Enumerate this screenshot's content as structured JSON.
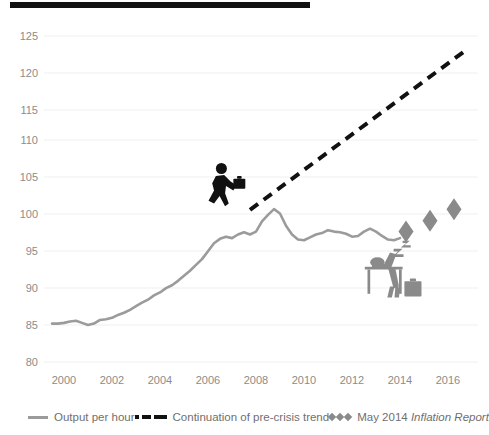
{
  "chart_data": {
    "type": "line",
    "title": "",
    "xlabel": "",
    "ylabel": "",
    "xlim": [
      1999.0,
      2017.3
    ],
    "ylim": [
      80,
      125
    ],
    "grid": true,
    "y_ticks": [
      125,
      120,
      115,
      110,
      105,
      100,
      95,
      90,
      85,
      80
    ],
    "x_ticks": [
      2000,
      2002,
      2004,
      2006,
      2008,
      2010,
      2012,
      2014,
      2016
    ],
    "legend_position": "bottom",
    "series": [
      {
        "name": "Output per hour",
        "type": "line",
        "color": "#9b9b9b",
        "x": [
          1999.5,
          1999.75,
          2000.0,
          2000.25,
          2000.5,
          2000.75,
          2001.0,
          2001.25,
          2001.5,
          2001.75,
          2002.0,
          2002.25,
          2002.5,
          2002.75,
          2003.0,
          2003.25,
          2003.5,
          2003.75,
          2004.0,
          2004.25,
          2004.5,
          2004.75,
          2005.0,
          2005.25,
          2005.5,
          2005.75,
          2006.0,
          2006.25,
          2006.5,
          2006.75,
          2007.0,
          2007.25,
          2007.5,
          2007.75,
          2008.0,
          2008.25,
          2008.5,
          2008.75,
          2009.0,
          2009.25,
          2009.5,
          2009.75,
          2010.0,
          2010.25,
          2010.5,
          2010.75,
          2011.0,
          2011.25,
          2011.5,
          2011.75,
          2012.0,
          2012.25,
          2012.5,
          2012.75,
          2013.0,
          2013.25,
          2013.5,
          2013.75,
          2014.0
        ],
        "values": [
          85.3,
          85.3,
          85.4,
          85.6,
          85.7,
          85.4,
          85.1,
          85.3,
          85.8,
          85.9,
          86.1,
          86.5,
          86.8,
          87.2,
          87.7,
          88.2,
          88.6,
          89.2,
          89.6,
          90.2,
          90.6,
          91.2,
          91.9,
          92.6,
          93.4,
          94.2,
          95.3,
          96.4,
          97.0,
          97.3,
          97.1,
          97.6,
          97.9,
          97.6,
          98.0,
          99.4,
          100.3,
          101.1,
          100.5,
          98.8,
          97.6,
          96.9,
          96.8,
          97.2,
          97.6,
          97.8,
          98.2,
          98.0,
          97.9,
          97.7,
          97.3,
          97.4,
          98.0,
          98.4,
          98.0,
          97.4,
          96.9,
          96.8,
          97.1
        ]
      },
      {
        "name": "Continuation of pre-crisis trend",
        "type": "line-dashed",
        "color": "#111111",
        "x": [
          2007.75,
          2016.85
        ],
        "values": [
          101.0,
          123.3
        ]
      },
      {
        "name": "May 2014 Inflation Report",
        "type": "scatter-diamond",
        "color": "#8a8a8a",
        "x": [
          2014.25,
          2015.25,
          2016.25
        ],
        "values": [
          98.0,
          99.5,
          101.1
        ]
      }
    ],
    "annotations": [
      {
        "name": "walking-businessman-icon",
        "x": 2006.0,
        "y": 104.0
      },
      {
        "name": "sleeping-worker-at-desk-icon",
        "x": 2013.4,
        "y": 92.0
      }
    ]
  },
  "axes": {
    "y_labels": [
      "125",
      "120",
      "115",
      "110",
      "105",
      "100",
      "95",
      "90",
      "85",
      "80"
    ],
    "x_labels": [
      "2000",
      "2002",
      "2004",
      "2006",
      "2008",
      "2010",
      "2012",
      "2014",
      "2016"
    ]
  },
  "legend": {
    "items": [
      {
        "key": "output-per-hour",
        "label": "Output per hour",
        "marker": "solid-line",
        "color": "#9b9b9b"
      },
      {
        "key": "pre-crisis-trend",
        "label": "Continuation of pre-crisis trend",
        "marker": "dashed-line",
        "color": "#111111"
      },
      {
        "key": "may-2014-inflation-report",
        "label_plain": "May 2014 ",
        "label_italic": "Inflation Report",
        "marker": "diamonds",
        "color": "#8a8a8a"
      }
    ]
  }
}
